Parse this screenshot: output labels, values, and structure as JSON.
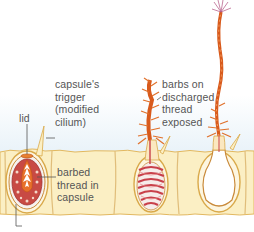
{
  "figure": {
    "colors": {
      "background": "#ffffff",
      "water_tint": "#eaf3f9",
      "cell_fill": "#fbefc4",
      "cell_border": "#d9a94a",
      "capsule_outline": "#c9862a",
      "thread": "#d85a1c",
      "thread_coil": "#c8404a",
      "capsule_inner": "#b83a3a",
      "barb_tip": "#b05080",
      "label_text": "#555555",
      "leader_line": "#555555"
    },
    "labels": {
      "trigger": [
        "capsule's",
        "trigger",
        "(modified",
        "cilium)"
      ],
      "lid": "lid",
      "barbed_thread": [
        "barbed",
        "thread in",
        "capsule"
      ],
      "barbs_exposed": [
        "barbs on",
        "discharged",
        "thread",
        "exposed"
      ]
    },
    "stages": [
      {
        "name": "undischarged",
        "description": "capsule with lid and coiled barbed thread"
      },
      {
        "name": "discharging",
        "description": "lid open, thread everting with barbs exposed"
      },
      {
        "name": "discharged",
        "description": "empty capsule with fully extended thread"
      }
    ],
    "bottom_caption_partial": "— cut off —"
  }
}
